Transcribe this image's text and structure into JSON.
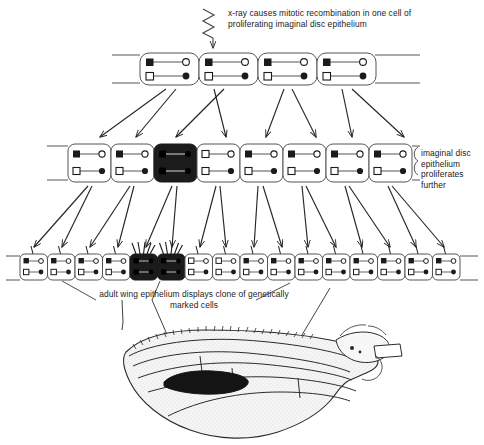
{
  "figure": {
    "captions": {
      "xray": "x-ray causes mitotic recombination in one cell of proliferating imaginal disc epithelium",
      "side": "imaginal disc epithelium proliferates further",
      "clone": "adult wing epithelium displays clone of genetically marked cells"
    },
    "colors": {
      "ink": "#1a1a1a",
      "line": "#333333",
      "marked_cell_fill": "#1b1b1b",
      "wing_fill": "#f4f4f4",
      "clone_patch": "#141414",
      "paper": "#ffffff"
    },
    "rows": [
      {
        "name": "row-top",
        "label": "proliferating imaginal disc epithelium",
        "cell_count": 4,
        "cells": [
          {
            "marked": false,
            "top": [
              "filled-square",
              "open-circle"
            ],
            "bottom": [
              "open-square",
              "filled-circle"
            ]
          },
          {
            "marked": false,
            "top": [
              "filled-square",
              "open-circle"
            ],
            "bottom": [
              "open-square",
              "filled-circle"
            ]
          },
          {
            "marked": false,
            "top": [
              "filled-square",
              "open-circle"
            ],
            "bottom": [
              "open-square",
              "filled-circle"
            ]
          },
          {
            "marked": false,
            "top": [
              "filled-square",
              "open-circle"
            ],
            "bottom": [
              "open-square",
              "filled-circle"
            ]
          }
        ]
      },
      {
        "name": "row-middle",
        "label": "imaginal disc epithelium proliferates further",
        "cell_count": 8,
        "cells": [
          {
            "marked": false,
            "top": [
              "filled-square",
              "open-circle"
            ],
            "bottom": [
              "open-square",
              "filled-circle"
            ]
          },
          {
            "marked": false,
            "top": [
              "filled-square",
              "open-circle"
            ],
            "bottom": [
              "open-square",
              "filled-circle"
            ]
          },
          {
            "marked": true,
            "top": [
              "filled-square",
              "filled-circle"
            ],
            "bottom": [
              "filled-square",
              "filled-circle"
            ]
          },
          {
            "marked": false,
            "top": [
              "open-square",
              "open-circle"
            ],
            "bottom": [
              "open-square",
              "filled-circle"
            ]
          },
          {
            "marked": false,
            "top": [
              "filled-square",
              "open-circle"
            ],
            "bottom": [
              "open-square",
              "filled-circle"
            ]
          },
          {
            "marked": false,
            "top": [
              "filled-square",
              "open-circle"
            ],
            "bottom": [
              "open-square",
              "filled-circle"
            ]
          },
          {
            "marked": false,
            "top": [
              "filled-square",
              "open-circle"
            ],
            "bottom": [
              "open-square",
              "filled-circle"
            ]
          },
          {
            "marked": false,
            "top": [
              "filled-square",
              "open-circle"
            ],
            "bottom": [
              "open-square",
              "filled-circle"
            ]
          }
        ]
      },
      {
        "name": "row-bottom",
        "label": "adult wing epithelium",
        "cell_count": 16,
        "cells": [
          {
            "marked": false,
            "bristles": 1
          },
          {
            "marked": false,
            "bristles": 1
          },
          {
            "marked": false,
            "bristles": 1
          },
          {
            "marked": false,
            "bristles": 1
          },
          {
            "marked": true,
            "bristles": 5
          },
          {
            "marked": true,
            "bristles": 5
          },
          {
            "marked": false,
            "bristles": 1
          },
          {
            "marked": false,
            "bristles": 1
          },
          {
            "marked": false,
            "bristles": 1
          },
          {
            "marked": false,
            "bristles": 1
          },
          {
            "marked": false,
            "bristles": 1
          },
          {
            "marked": false,
            "bristles": 1
          },
          {
            "marked": false,
            "bristles": 1
          },
          {
            "marked": false,
            "bristles": 1
          },
          {
            "marked": false,
            "bristles": 1
          },
          {
            "marked": false,
            "bristles": 1
          }
        ]
      }
    ],
    "wing": {
      "name": "adult-wing",
      "clone_patch_label": "dark clone of genetically marked cells"
    }
  }
}
